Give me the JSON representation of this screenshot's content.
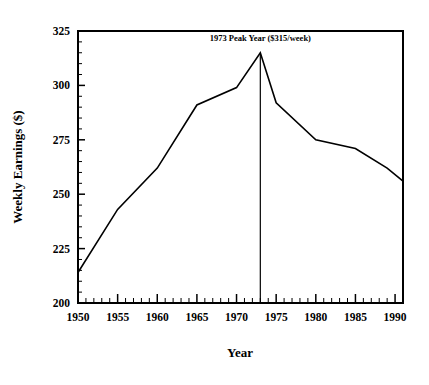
{
  "chart_data": {
    "type": "line",
    "title": "",
    "subtitle": "",
    "xlabel": "Year",
    "ylabel": "Weekly Earnings ($)",
    "xlim": [
      1950,
      1991
    ],
    "ylim": [
      200,
      325
    ],
    "grid": false,
    "legend": null,
    "x_ticks": [
      1950,
      1955,
      1960,
      1965,
      1970,
      1975,
      1980,
      1985,
      1990
    ],
    "x_tick_labels": [
      "1950",
      "1955",
      "1960",
      "1965",
      "1970",
      "1975",
      "1980",
      "1985",
      "1990"
    ],
    "x_minor_tick_interval": 1,
    "y_ticks": [
      200,
      225,
      250,
      275,
      300,
      325
    ],
    "y_tick_labels": [
      "200",
      "225",
      "250",
      "275",
      "300",
      "325"
    ],
    "y_minor_tick_interval": 5,
    "line_color": "#000000",
    "series": [
      {
        "name": "Weekly Earnings",
        "x": [
          1950,
          1955,
          1960,
          1965,
          1970,
          1973,
          1975,
          1980,
          1985,
          1989,
          1991
        ],
        "values": [
          214,
          243,
          262,
          291,
          299,
          315,
          292,
          275,
          271,
          262,
          256
        ]
      }
    ],
    "annotations": [
      {
        "text": "1973 Peak Year ($315/week)",
        "x": 1973,
        "y": 322,
        "marker": "vertical-rule",
        "rule_from": 200,
        "rule_to": 315
      }
    ]
  },
  "axes": {
    "x_axis_title": "Year",
    "y_axis_title": "Weekly Earnings ($)"
  }
}
